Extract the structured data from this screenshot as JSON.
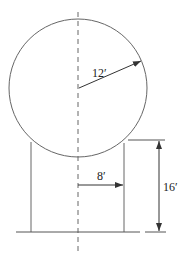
{
  "diagram": {
    "type": "tank-sphere-on-cylinder",
    "colors": {
      "line": "#555555",
      "text": "#222222",
      "background": "#ffffff"
    },
    "labels": {
      "sphere_radius": "12′",
      "cylinder_radius": "8′",
      "cylinder_height": "16′"
    }
  }
}
